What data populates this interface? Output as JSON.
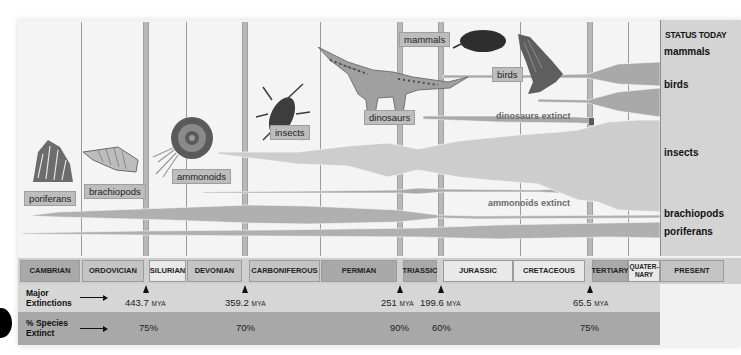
{
  "status_today": {
    "title": "STATUS TODAY",
    "labels": [
      "mammals",
      "birds",
      "insects",
      "brachiopods",
      "poriferans"
    ]
  },
  "organisms": {
    "poriferans": "poriferans",
    "brachiopods": "brachiopods",
    "ammonoids": "ammonoids",
    "insects": "insects",
    "dinosaurs": "dinosaurs",
    "mammals": "mammals",
    "birds": "birds"
  },
  "annotations": {
    "dinosaurs_extinct": "dinosaurs extinct",
    "ammonoids_extinct": "ammonoids extinct"
  },
  "periods": [
    {
      "label": "CAMBRIAN"
    },
    {
      "label": "ORDOVICIAN"
    },
    {
      "label": "SILURIAN"
    },
    {
      "label": "DEVONIAN"
    },
    {
      "label": "CARBONIFEROUS"
    },
    {
      "label": "PERMIAN"
    },
    {
      "label": "TRIASSIC"
    },
    {
      "label": "JURASSIC"
    },
    {
      "label": "CRETACEOUS"
    },
    {
      "label": "TERTIARY"
    },
    {
      "label": "QUATER-NARY"
    },
    {
      "label": "PRESENT"
    }
  ],
  "extinctions": {
    "row_label_line1": "Major",
    "row_label_line2": "Extinctions",
    "unit": "MYA",
    "events": [
      {
        "mya": "443.7",
        "percent": "75%"
      },
      {
        "mya": "359.2",
        "percent": "70%"
      },
      {
        "mya": "251",
        "percent": "90%"
      },
      {
        "mya": "199.6",
        "percent": "60%"
      },
      {
        "mya": "65.5",
        "percent": "75%"
      }
    ]
  },
  "species": {
    "row_label_line1": "% Species",
    "row_label_line2": "Extinct"
  }
}
